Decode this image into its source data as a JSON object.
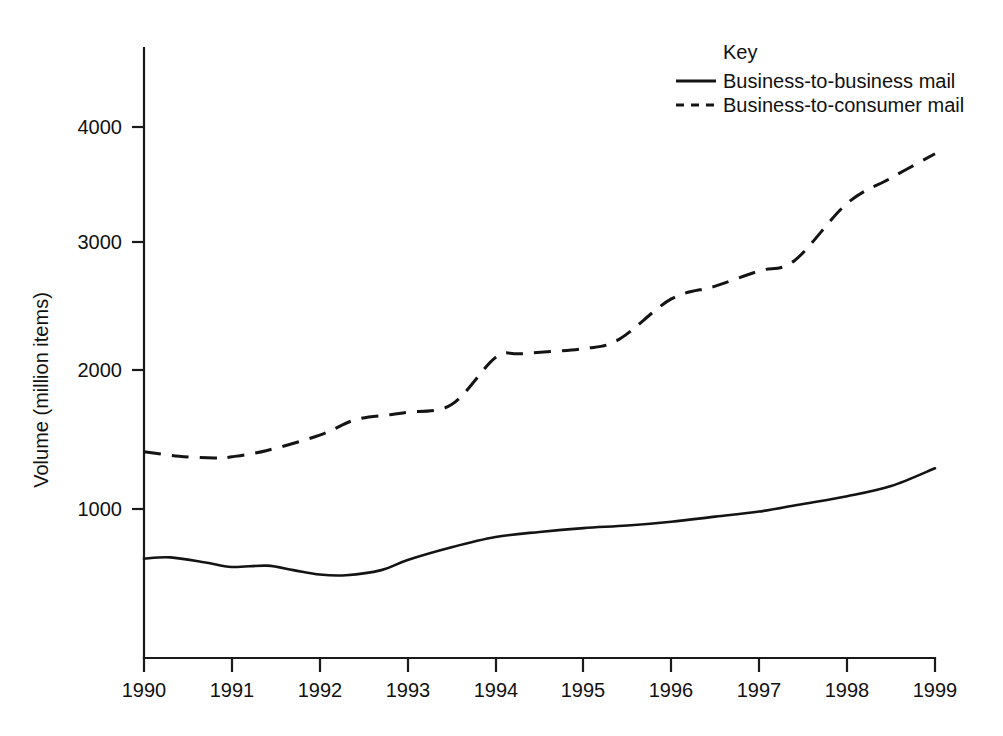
{
  "chart_data": {
    "type": "line",
    "title": "",
    "xlabel": "",
    "ylabel": "Volume (million items)",
    "xlim": [
      1990,
      1999
    ],
    "ylim": [
      0,
      4600
    ],
    "grid": false,
    "legend_position": "top-right",
    "legend_title": "Key",
    "x_tick_labels": [
      "1990",
      "1991",
      "1992",
      "1993",
      "1994",
      "1995",
      "1996",
      "1997",
      "1998",
      "1999"
    ],
    "y_tick_labels": [
      "1000",
      "2000",
      "3000",
      "4000"
    ],
    "y_ticks": [
      1000,
      2000,
      3000,
      4000
    ],
    "series": [
      {
        "name": "Business-to-business mail",
        "style": "solid",
        "color": "#141414",
        "x": [
          1990,
          1990.3,
          1990.7,
          1991,
          1991.4,
          1991.7,
          1992,
          1992.3,
          1992.7,
          1993,
          1993.5,
          1994,
          1994.5,
          1995,
          1995.5,
          1996,
          1996.5,
          1997,
          1997.5,
          1998,
          1998.5,
          1999
        ],
        "values": [
          610,
          620,
          580,
          545,
          555,
          520,
          485,
          480,
          520,
          600,
          700,
          780,
          820,
          850,
          870,
          900,
          940,
          980,
          1040,
          1100,
          1180,
          1320
        ]
      },
      {
        "name": "Business-to-consumer mail",
        "style": "dashed",
        "color": "#141414",
        "x": [
          1990,
          1990.4,
          1990.8,
          1991,
          1991.4,
          1992,
          1992.4,
          1992.8,
          1993,
          1993.5,
          1994,
          1994.3,
          1995,
          1995.4,
          1996,
          1996.5,
          1997,
          1997.4,
          1998,
          1998.5,
          1999
        ],
        "values": [
          1450,
          1415,
          1400,
          1410,
          1460,
          1580,
          1700,
          1740,
          1760,
          1820,
          2190,
          2220,
          2260,
          2330,
          2650,
          2750,
          2870,
          2950,
          3400,
          3600,
          3790
        ]
      }
    ]
  },
  "legend": {
    "title": "Key",
    "entries": [
      {
        "label": "Business-to-business mail",
        "style": "solid"
      },
      {
        "label": "Business-to-consumer mail",
        "style": "dashed"
      }
    ]
  },
  "axes": {
    "y_title": "Volume (million items)",
    "y_tick_labels": [
      "4000",
      "3000",
      "2000",
      "1000"
    ],
    "x_tick_labels": [
      "1990",
      "1991",
      "1992",
      "1993",
      "1994",
      "1995",
      "1996",
      "1997",
      "1998",
      "1999"
    ]
  },
  "colors": {
    "ink": "#141414",
    "background": "#ffffff"
  }
}
